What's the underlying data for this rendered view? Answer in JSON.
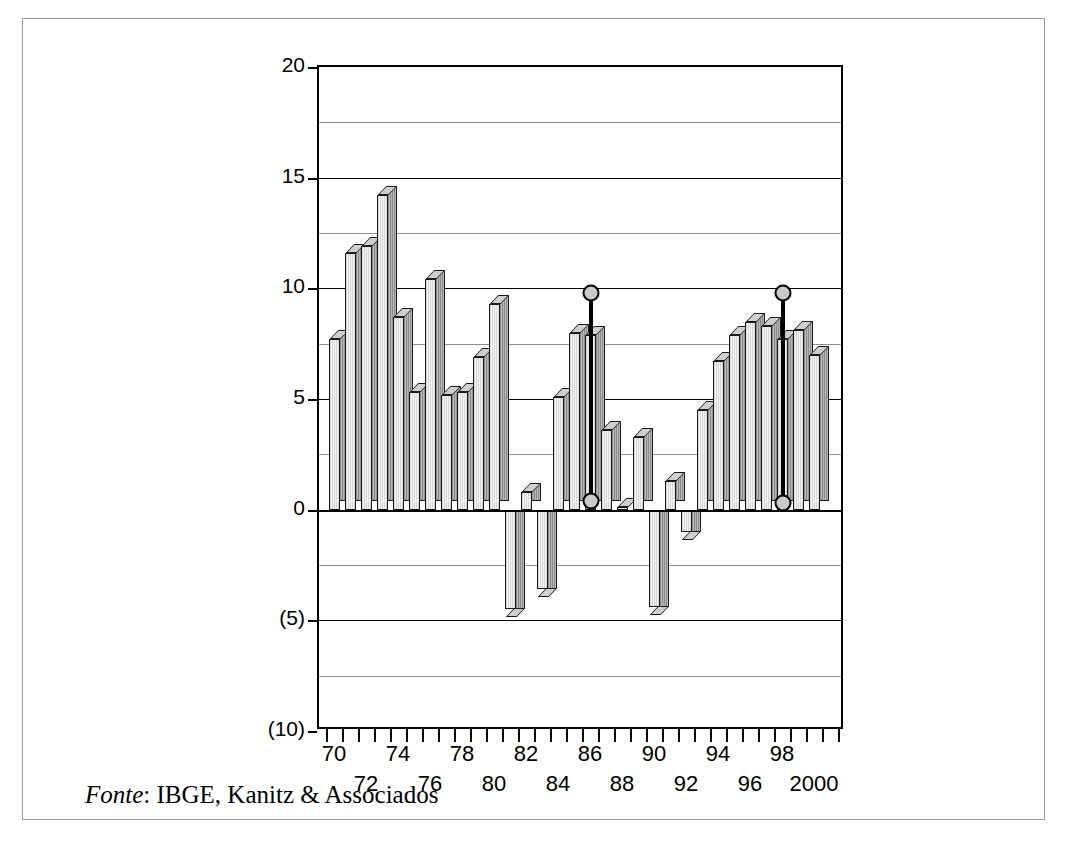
{
  "caption": {
    "source_label": "Fonte",
    "source_text": ": IBGE, Kanitz & Associados"
  },
  "chart_data": {
    "type": "bar",
    "title": "",
    "subtitle": "",
    "xlabel": "",
    "ylabel": "",
    "grid": true,
    "legend": "none",
    "ylim": [
      -10,
      20
    ],
    "ytick_labels": [
      "20",
      "15",
      "10",
      "5",
      "0",
      "(5)",
      "(10)"
    ],
    "ytick_values": [
      20,
      15,
      10,
      5,
      0,
      -5,
      -10
    ],
    "gridline_values": [
      20,
      17.5,
      15,
      12.5,
      10,
      7.5,
      5,
      2.5,
      0,
      -2.5,
      -5,
      -7.5,
      -10
    ],
    "xtick_row_a": [
      "70",
      "74",
      "78",
      "82",
      "86",
      "90",
      "94",
      "98"
    ],
    "xtick_row_b": [
      "72",
      "76",
      "80",
      "84",
      "88",
      "92",
      "96",
      "2000"
    ],
    "categories": [
      "70",
      "71",
      "72",
      "73",
      "74",
      "75",
      "76",
      "77",
      "78",
      "79",
      "80",
      "81",
      "82",
      "83",
      "84",
      "85",
      "86",
      "87",
      "88",
      "89",
      "90",
      "91",
      "92",
      "93",
      "94",
      "95",
      "96",
      "97",
      "98",
      "99",
      "2000",
      "01"
    ],
    "values": [
      7.7,
      11.6,
      11.9,
      14.2,
      8.7,
      5.3,
      10.4,
      5.2,
      5.3,
      6.9,
      9.3,
      -4.5,
      0.8,
      -3.6,
      5.1,
      8.0,
      7.9,
      3.6,
      0.1,
      3.3,
      -4.4,
      1.3,
      -1.0,
      4.5,
      6.7,
      7.9,
      8.5,
      8.3,
      7.7,
      8.1,
      7.0,
      0.0
    ],
    "annotations": [
      {
        "name": "marker-1986",
        "category": "86",
        "top": 9.8,
        "bottom": 0.4
      },
      {
        "name": "marker-1998",
        "category": "98",
        "top": 9.8,
        "bottom": 0.3
      }
    ]
  }
}
